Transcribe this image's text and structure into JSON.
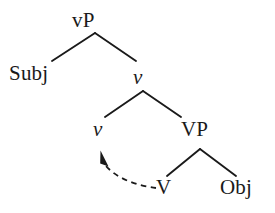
{
  "diagram": {
    "type": "syntax-tree",
    "background_color": "#ffffff",
    "line_color": "#1a1a1a",
    "text_color": "#1a1a1a",
    "nodes": {
      "root": {
        "label_v": "v",
        "label_p": "P",
        "full": "vP"
      },
      "subject": {
        "label": "Subj"
      },
      "little_v_mid": {
        "label": "v"
      },
      "little_v_low": {
        "label": "v"
      },
      "verb_phrase": {
        "label": "VP"
      },
      "verb_head": {
        "label": "V"
      },
      "object": {
        "label": "Obj"
      }
    },
    "movement_arrow": {
      "style": "dashed",
      "from": "V",
      "to": "v",
      "arrowhead": "filled-triangle"
    }
  }
}
